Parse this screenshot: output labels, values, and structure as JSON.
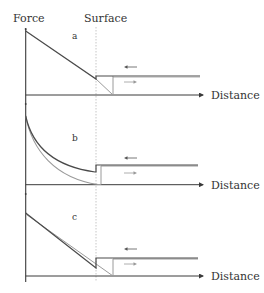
{
  "figure": {
    "y_axis_label": "Force",
    "surface_label": "Surface",
    "x_axis_label": "Distance",
    "colors": {
      "approach_dark": "#4a4a4a",
      "retract_gray": "#9a9a9a",
      "axis": "#3a3a3a",
      "surface_line": "#b8b8b8",
      "text": "#333333"
    },
    "panels": [
      {
        "label": "a",
        "description": "linear force (dark) with step at surface; gray retract line reaching zero beyond surface"
      },
      {
        "label": "b",
        "description": "exponential-like decaying curves (dark and gray) with step at surface"
      },
      {
        "label": "c",
        "description": "nearly overlapping linear curves with step at surface"
      }
    ],
    "arrow_left": "←",
    "arrow_right": "→"
  }
}
